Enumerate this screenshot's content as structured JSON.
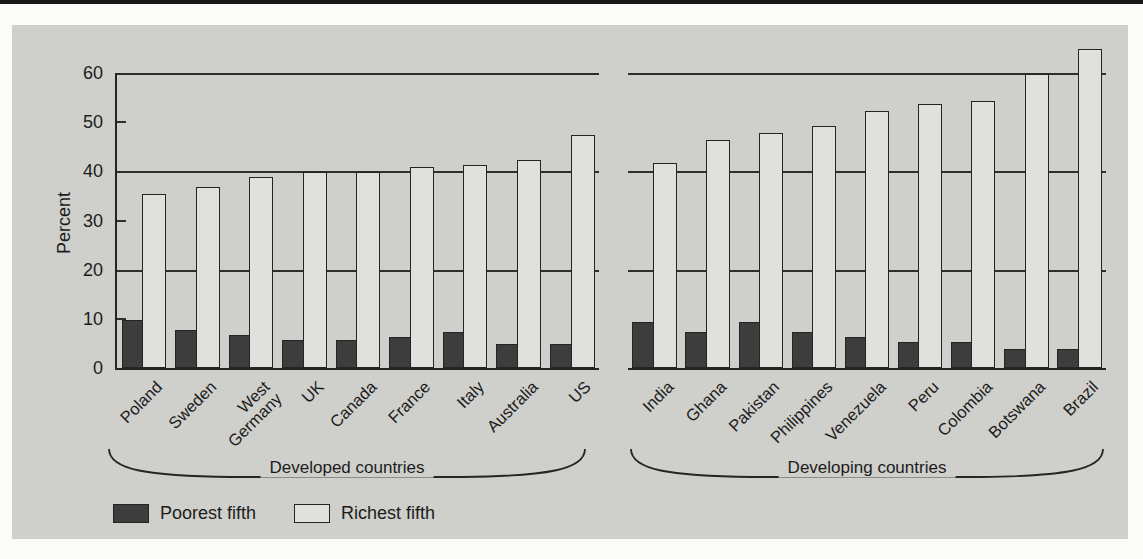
{
  "chart_data": {
    "type": "bar",
    "title": "",
    "xlabel": "",
    "ylabel": "Percent",
    "ylim": [
      0,
      60
    ],
    "yticks": [
      0,
      10,
      20,
      30,
      40,
      50,
      60
    ],
    "gridlines": [
      20,
      40,
      60
    ],
    "grid": "horizontal lines at 20/40/60 only, small inner ticks at 10/30/50",
    "legend_position": "bottom-left",
    "groups": [
      {
        "label": "Developed countries",
        "categories": [
          "Poland",
          "Sweden",
          "West\nGermany",
          "UK",
          "Canada",
          "France",
          "Italy",
          "Australia",
          "US"
        ],
        "series": [
          {
            "name": "Poorest fifth",
            "values": [
              10,
              8,
              7,
              6,
              6,
              6.5,
              7.5,
              5,
              5
            ]
          },
          {
            "name": "Richest fifth",
            "values": [
              35.5,
              37,
              39,
              40,
              40,
              41,
              41.5,
              42.5,
              47.5
            ]
          }
        ]
      },
      {
        "label": "Developing countries",
        "categories": [
          "India",
          "Ghana",
          "Pakistan",
          "Philippines",
          "Venezuela",
          "Peru",
          "Colombia",
          "Botswana",
          "Brazil"
        ],
        "series": [
          {
            "name": "Poorest fifth",
            "values": [
              9.5,
              7.5,
              9.5,
              7.5,
              6.5,
              5.5,
              5.5,
              4,
              4
            ]
          },
          {
            "name": "Richest fifth",
            "values": [
              42,
              46.5,
              48,
              49.5,
              52.5,
              54,
              54.5,
              60,
              65
            ]
          }
        ]
      }
    ],
    "legend": [
      {
        "label": "Poorest fifth",
        "color": "#3d3d3d"
      },
      {
        "label": "Richest fifth",
        "color": "#e0e0dc"
      }
    ]
  },
  "colors": {
    "panel_background": "#cfcfcb",
    "bar_dark": "#3d3d3d",
    "bar_light": "#e0e0dc",
    "line": "#252525",
    "top_strip": "#161616"
  }
}
